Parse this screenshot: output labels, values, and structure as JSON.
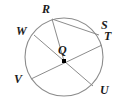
{
  "figure": {
    "type": "circle-geometry-diagram",
    "background_color": "#ffffff",
    "stroke_color": "#8c8c8c",
    "label_color": "#1b1b1b",
    "center_marker_color": "#000000",
    "circle": {
      "center_x": 64,
      "center_y": 57,
      "radius": 39
    },
    "center_point": {
      "name": "Q",
      "label": "Q",
      "x": 64,
      "y": 61,
      "marker_size": 4,
      "label_x": 58,
      "label_y": 44
    },
    "points": [
      {
        "name": "R",
        "label": "R",
        "x": 52,
        "y": 19,
        "label_x": 42,
        "label_y": 3
      },
      {
        "name": "S",
        "label": "S",
        "x": 99,
        "y": 35,
        "label_x": 101,
        "label_y": 19
      },
      {
        "name": "T",
        "label": "T",
        "x": 102,
        "y": 45,
        "label_x": 104,
        "label_y": 30
      },
      {
        "name": "U",
        "label": "U",
        "x": 93,
        "y": 86,
        "label_x": 100,
        "label_y": 84
      },
      {
        "name": "V",
        "label": "V",
        "x": 31,
        "y": 79,
        "label_x": 14,
        "label_y": 73
      },
      {
        "name": "W",
        "label": "W",
        "x": 34,
        "y": 35,
        "label_x": 16,
        "label_y": 25
      }
    ],
    "segments": [
      {
        "name": "diameter-WU",
        "from": "W",
        "to": "U",
        "through_center": true
      },
      {
        "name": "diameter-VT",
        "from": "V",
        "to": "T",
        "through_center": true
      },
      {
        "name": "chord-RS",
        "from": "R",
        "to": "S",
        "through_center": false
      },
      {
        "name": "radius-QR",
        "from": "Q",
        "to": "R",
        "through_center": false
      }
    ]
  }
}
